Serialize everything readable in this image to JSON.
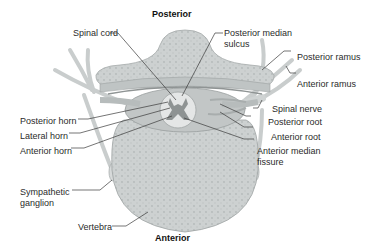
{
  "diagram": {
    "orientation": {
      "top": "Posterior",
      "bottom": "Anterior"
    },
    "labels": {
      "spinal_cord": "Spinal cord",
      "posterior_median_sulcus_1": "Posterior median",
      "posterior_median_sulcus_2": "sulcus",
      "posterior_ramus": "Posterior ramus",
      "anterior_ramus": "Anterior ramus",
      "spinal_nerve": "Spinal nerve",
      "posterior_root": "Posterior root",
      "anterior_root": "Anterior root",
      "anterior_median_fissure_1": "Anterior median",
      "anterior_median_fissure_2": "fissure",
      "posterior_horn": "Posterior horn",
      "lateral_horn": "Lateral horn",
      "anterior_horn": "Anterior horn",
      "sympathetic_ganglion_1": "Sympathetic",
      "sympathetic_ganglion_2": "ganglion",
      "vertebra": "Vertebra"
    },
    "colors": {
      "bone": "#cfd3d3",
      "bone_dark": "#a9aeae",
      "nerve": "#d9dcdc",
      "cord": "#e6e8e8",
      "gray_matter": "#8d9292",
      "leader_line": "#3a3a3a"
    }
  }
}
